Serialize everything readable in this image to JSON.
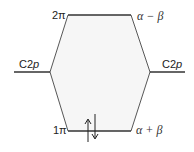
{
  "diagram": {
    "type": "molecular-orbital-energy-diagram",
    "colors": {
      "line": "#333333",
      "fill": "#f6f6f6"
    },
    "levels": {
      "top": {
        "orbital_label": "2π",
        "energy_label": "α − β"
      },
      "bottom": {
        "orbital_label": "1π",
        "energy_label": "α + β",
        "electrons": "↑↓"
      },
      "left_atomic": {
        "label_main": "C2",
        "label_italic": "p"
      },
      "right_atomic": {
        "label_main": "C2",
        "label_italic": "p"
      }
    }
  }
}
